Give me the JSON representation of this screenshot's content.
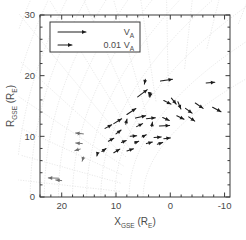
{
  "chart_data": {
    "type": "scatter",
    "plot_kind": "quiver-vector-field",
    "title": "",
    "xlabel": "X_GSE (R_E)",
    "ylabel": "R_GSE (R_E)",
    "xlabel_base": "X",
    "xlabel_sub": "GSE",
    "xlabel_unit_base": "R",
    "xlabel_unit_sub": "E",
    "ylabel_base": "R",
    "ylabel_sub": "GSE",
    "ylabel_unit_base": "R",
    "ylabel_unit_sub": "E",
    "xlim": [
      24,
      -11
    ],
    "ylim": [
      0,
      30
    ],
    "x_ticks": [
      20,
      10,
      0,
      -10
    ],
    "x_tick_labels": [
      "20",
      "10",
      "0",
      "-10"
    ],
    "x_minor_per_major": 5,
    "y_ticks": [
      0,
      10,
      20,
      30
    ],
    "y_tick_labels": [
      "0",
      "10",
      "20",
      "30"
    ],
    "y_minor_per_major": 5,
    "x_axis_reversed": true,
    "grid": true,
    "grid_style": "curvilinear-dotted-magnetosphere",
    "legend_position": "top-left",
    "legend": [
      {
        "label": "V_A",
        "label_base": "V",
        "label_sub": "A",
        "arrow_length_px": 28,
        "scale": 1.0
      },
      {
        "label": "0.01 V_A",
        "label_prefix": "0.01",
        "label_base": "V",
        "label_sub": "A",
        "arrow_length_px": 14,
        "scale": 0.01
      }
    ],
    "vector_color": "#1c1c1c",
    "faint_vector_color": "#6e6e6e",
    "grid_color": "#d9d9d9",
    "axis_color": "#3a3a3a",
    "vectors": [
      {
        "x": 4.6,
        "y": 19.4,
        "dx": -0.3,
        "dy": -1.6,
        "faint": false
      },
      {
        "x": 1.8,
        "y": 19.1,
        "dx": 4.0,
        "dy": 0.6,
        "faint": false
      },
      {
        "x": -6.6,
        "y": 18.8,
        "dx": 2.9,
        "dy": 0.2,
        "faint": false
      },
      {
        "x": 3.6,
        "y": 17.1,
        "dx": -0.3,
        "dy": -1.3,
        "faint": false
      },
      {
        "x": 6.0,
        "y": 16.5,
        "dx": 3.2,
        "dy": 2.4,
        "faint": false
      },
      {
        "x": -0.2,
        "y": 16.3,
        "dx": 1.6,
        "dy": -2.0,
        "faint": false
      },
      {
        "x": 1.2,
        "y": 15.9,
        "dx": 2.4,
        "dy": -1.2,
        "faint": false
      },
      {
        "x": -1.4,
        "y": 15.7,
        "dx": 1.0,
        "dy": -2.4,
        "faint": false
      },
      {
        "x": -4.6,
        "y": 15.5,
        "dx": 2.6,
        "dy": -1.8,
        "faint": false
      },
      {
        "x": -2.8,
        "y": 14.6,
        "dx": 2.2,
        "dy": -1.6,
        "faint": false
      },
      {
        "x": -7.8,
        "y": 14.8,
        "dx": 2.8,
        "dy": -1.5,
        "faint": false
      },
      {
        "x": 8.0,
        "y": 13.6,
        "dx": 3.0,
        "dy": 2.0,
        "faint": false
      },
      {
        "x": 6.4,
        "y": 13.0,
        "dx": 3.4,
        "dy": 0.8,
        "faint": false
      },
      {
        "x": 4.4,
        "y": 12.9,
        "dx": 3.0,
        "dy": 0.3,
        "faint": false
      },
      {
        "x": 1.4,
        "y": 13.1,
        "dx": 2.2,
        "dy": -1.0,
        "faint": false
      },
      {
        "x": -1.2,
        "y": 13.4,
        "dx": 2.4,
        "dy": -1.2,
        "faint": false
      },
      {
        "x": -3.4,
        "y": 13.2,
        "dx": 2.0,
        "dy": -1.4,
        "faint": false
      },
      {
        "x": 10.4,
        "y": 12.1,
        "dx": 2.6,
        "dy": 1.6,
        "faint": false
      },
      {
        "x": 8.2,
        "y": 12.0,
        "dx": 0.4,
        "dy": 1.7,
        "faint": false
      },
      {
        "x": 6.2,
        "y": 11.6,
        "dx": 2.0,
        "dy": 1.0,
        "faint": false
      },
      {
        "x": 3.4,
        "y": 11.6,
        "dx": 0.2,
        "dy": 1.5,
        "faint": false
      },
      {
        "x": 2.0,
        "y": 11.7,
        "dx": 3.4,
        "dy": 0.2,
        "faint": false
      },
      {
        "x": 12.0,
        "y": 11.3,
        "dx": 2.2,
        "dy": 1.2,
        "faint": false
      },
      {
        "x": 10.0,
        "y": 10.4,
        "dx": 1.7,
        "dy": 1.3,
        "faint": false
      },
      {
        "x": 7.4,
        "y": 10.0,
        "dx": 2.2,
        "dy": 0.2,
        "faint": false
      },
      {
        "x": 5.2,
        "y": 9.9,
        "dx": 1.4,
        "dy": 0.7,
        "faint": false
      },
      {
        "x": 3.0,
        "y": 9.8,
        "dx": 2.4,
        "dy": 0.2,
        "faint": false
      },
      {
        "x": 1.2,
        "y": 9.6,
        "dx": 2.2,
        "dy": 0.3,
        "faint": false
      },
      {
        "x": 11.4,
        "y": 9.2,
        "dx": 1.8,
        "dy": 1.0,
        "faint": false
      },
      {
        "x": 9.0,
        "y": 9.0,
        "dx": 1.6,
        "dy": 0.6,
        "faint": false
      },
      {
        "x": 6.6,
        "y": 8.9,
        "dx": 1.4,
        "dy": 0.6,
        "faint": false
      },
      {
        "x": 4.4,
        "y": 8.8,
        "dx": 2.0,
        "dy": 0.5,
        "faint": false
      },
      {
        "x": 2.4,
        "y": 8.7,
        "dx": 1.8,
        "dy": 0.6,
        "faint": false
      },
      {
        "x": 12.6,
        "y": 7.5,
        "dx": 1.4,
        "dy": 1.0,
        "faint": false
      },
      {
        "x": 10.4,
        "y": 7.3,
        "dx": 2.0,
        "dy": 1.2,
        "faint": false
      },
      {
        "x": 8.0,
        "y": 7.6,
        "dx": 2.2,
        "dy": 0.7,
        "faint": false
      },
      {
        "x": 13.4,
        "y": 7.2,
        "dx": -0.2,
        "dy": -0.9,
        "faint": false
      },
      {
        "x": 3.8,
        "y": 17.2,
        "dx": -0.2,
        "dy": -1.2,
        "faint": false
      },
      {
        "x": 16.0,
        "y": 10.4,
        "dx": -2.6,
        "dy": 0.3,
        "faint": true
      },
      {
        "x": 16.2,
        "y": 8.8,
        "dx": -2.2,
        "dy": 0.2,
        "faint": true
      },
      {
        "x": 16.6,
        "y": 7.9,
        "dx": -1.8,
        "dy": -0.5,
        "faint": true
      },
      {
        "x": 16.0,
        "y": 6.6,
        "dx": -0.4,
        "dy": -1.4,
        "faint": true
      },
      {
        "x": 20.6,
        "y": 3.1,
        "dx": -3.4,
        "dy": 0.1,
        "faint": true
      },
      {
        "x": 20.0,
        "y": 2.7,
        "dx": -2.0,
        "dy": 0.2,
        "faint": true
      }
    ]
  }
}
